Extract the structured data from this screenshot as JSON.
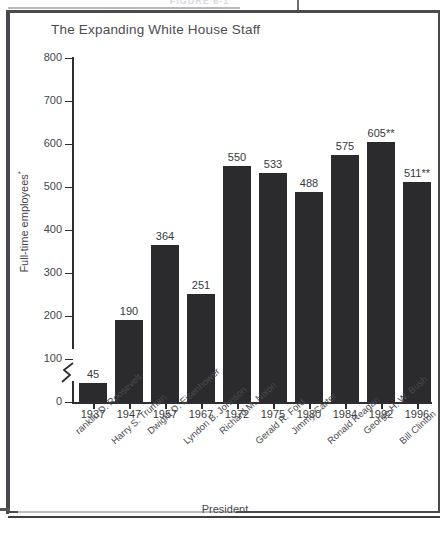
{
  "figure": {
    "number_label": "FIGURE 6-1",
    "caption_visible": false
  },
  "chart_data": {
    "type": "bar",
    "title": "The Expanding White House Staff",
    "xlabel": "President",
    "ylabel": "Full-time employees*",
    "ylim": [
      0,
      800
    ],
    "ytick_labels": [
      "0",
      "100",
      "200",
      "300",
      "400",
      "500",
      "600",
      "700",
      "800"
    ],
    "ytick_values": [
      0,
      100,
      200,
      300,
      400,
      500,
      600,
      700,
      800
    ],
    "grid": false,
    "legend": "none",
    "axis_break": true,
    "categories": [
      "1937",
      "1947",
      "1957",
      "1967",
      "1972",
      "1975",
      "1980",
      "1984",
      "1992",
      "1996"
    ],
    "values": [
      45,
      190,
      364,
      251,
      550,
      533,
      488,
      575,
      605,
      511
    ],
    "data_labels": [
      "45",
      "190",
      "364",
      "251",
      "550",
      "533",
      "488",
      "575",
      "605**",
      "511**"
    ],
    "group_labels": [
      "ranklin D. Roosevelt",
      "Harry S. Truman",
      "Dwight D. Eisenhower",
      "Lyndon B. Johnson",
      "Richard M. Nixon",
      "Gerald R. Ford",
      "Jimmy Carter",
      "Ronald Reagan",
      "George H. W. Bush",
      "Bill Clinton"
    ],
    "bar_color": "#2b2b2d",
    "axis_color": "#2f2f33",
    "text_color": "#45454a"
  }
}
